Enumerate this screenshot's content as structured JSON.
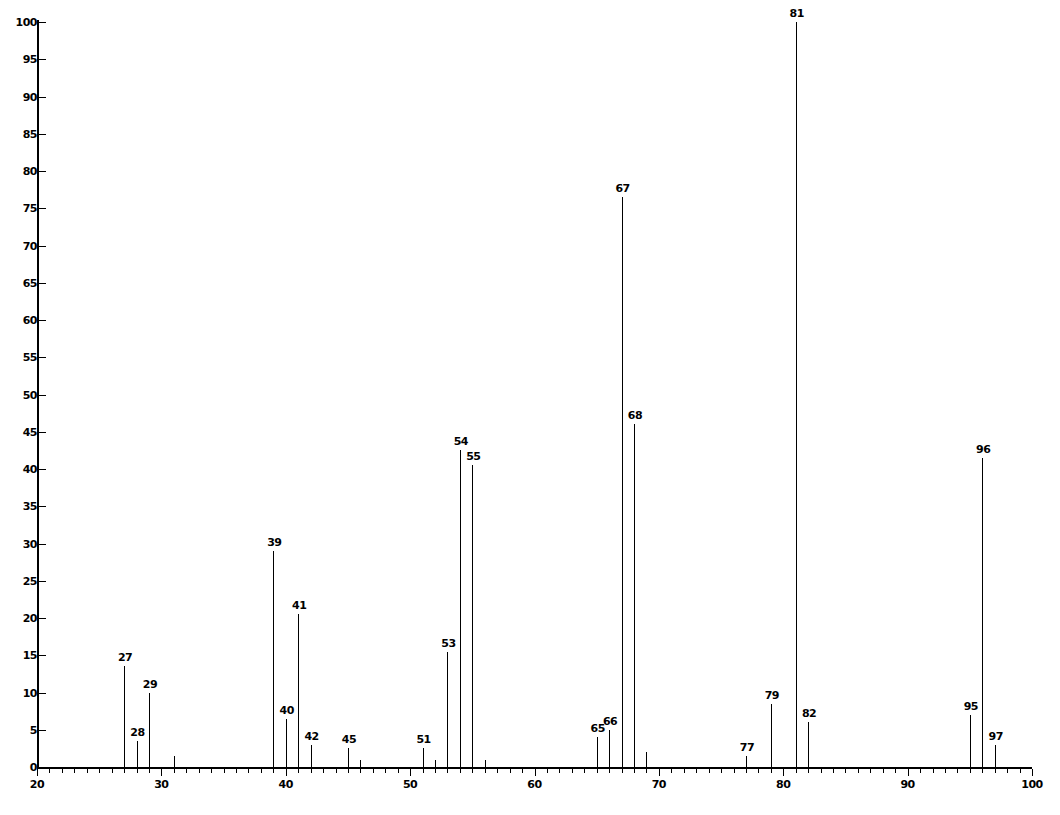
{
  "chart_data": {
    "type": "bar",
    "title": "",
    "subtitle": "",
    "xlabel": "",
    "ylabel": "",
    "xlim": [
      20,
      100
    ],
    "ylim": [
      0,
      100
    ],
    "grid": false,
    "legend": null,
    "x_tick_labels": [
      "20",
      "30",
      "40",
      "50",
      "60",
      "70",
      "80",
      "90",
      "100"
    ],
    "x_major_ticks": [
      20,
      30,
      40,
      50,
      60,
      70,
      80,
      90,
      100
    ],
    "x_minor_step": 1,
    "y_tick_labels": [
      "0",
      "5",
      "10",
      "15",
      "20",
      "25",
      "30",
      "35",
      "40",
      "45",
      "50",
      "55",
      "60",
      "65",
      "70",
      "75",
      "80",
      "85",
      "90",
      "95",
      "100"
    ],
    "y_major_ticks": [
      0,
      5,
      10,
      15,
      20,
      25,
      30,
      35,
      40,
      45,
      50,
      55,
      60,
      65,
      70,
      75,
      80,
      85,
      90,
      95,
      100
    ],
    "categories": [
      27,
      28,
      29,
      31,
      39,
      40,
      41,
      42,
      45,
      46,
      51,
      52,
      53,
      54,
      55,
      56,
      65,
      66,
      67,
      68,
      69,
      77,
      79,
      81,
      82,
      95,
      96,
      97
    ],
    "values": [
      13.5,
      3.5,
      10.0,
      1.5,
      29.0,
      6.5,
      20.5,
      3.0,
      2.5,
      1.0,
      2.5,
      1.0,
      15.5,
      42.5,
      40.5,
      1.0,
      4.0,
      5.0,
      76.5,
      46.0,
      2.0,
      1.5,
      8.5,
      100.0,
      6.0,
      7.0,
      41.5,
      3.0
    ],
    "labeled_peaks": [
      {
        "mz": 27,
        "intensity": 13.5,
        "label": "27"
      },
      {
        "mz": 28,
        "intensity": 3.5,
        "label": "28"
      },
      {
        "mz": 29,
        "intensity": 10.0,
        "label": "29"
      },
      {
        "mz": 39,
        "intensity": 29.0,
        "label": "39"
      },
      {
        "mz": 40,
        "intensity": 6.5,
        "label": "40"
      },
      {
        "mz": 41,
        "intensity": 20.5,
        "label": "41"
      },
      {
        "mz": 42,
        "intensity": 3.0,
        "label": "42"
      },
      {
        "mz": 45,
        "intensity": 2.5,
        "label": "45"
      },
      {
        "mz": 51,
        "intensity": 2.5,
        "label": "51"
      },
      {
        "mz": 53,
        "intensity": 15.5,
        "label": "53"
      },
      {
        "mz": 54,
        "intensity": 42.5,
        "label": "54"
      },
      {
        "mz": 55,
        "intensity": 40.5,
        "label": "55"
      },
      {
        "mz": 65,
        "intensity": 4.0,
        "label": "65"
      },
      {
        "mz": 66,
        "intensity": 5.0,
        "label": "66"
      },
      {
        "mz": 67,
        "intensity": 76.5,
        "label": "67"
      },
      {
        "mz": 68,
        "intensity": 46.0,
        "label": "68"
      },
      {
        "mz": 77,
        "intensity": 1.5,
        "label": "77"
      },
      {
        "mz": 79,
        "intensity": 8.5,
        "label": "79"
      },
      {
        "mz": 81,
        "intensity": 100.0,
        "label": "81"
      },
      {
        "mz": 82,
        "intensity": 6.0,
        "label": "82"
      },
      {
        "mz": 95,
        "intensity": 7.0,
        "label": "95"
      },
      {
        "mz": 96,
        "intensity": 41.5,
        "label": "96"
      },
      {
        "mz": 97,
        "intensity": 3.0,
        "label": "97"
      }
    ],
    "unlabeled_peaks": [
      {
        "mz": 31,
        "intensity": 1.5
      },
      {
        "mz": 46,
        "intensity": 1.0
      },
      {
        "mz": 52,
        "intensity": 1.0
      },
      {
        "mz": 56,
        "intensity": 1.0
      },
      {
        "mz": 69,
        "intensity": 2.0
      }
    ],
    "base_peak_mz": 81,
    "colors": {
      "axis": "#000000",
      "peak": "#000000",
      "text": "#000000",
      "background": "#ffffff"
    }
  }
}
